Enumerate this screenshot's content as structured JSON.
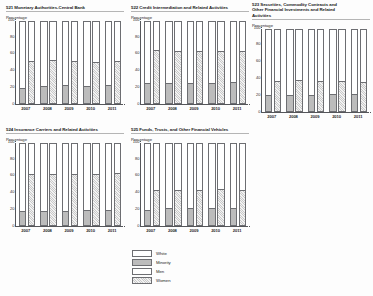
{
  "figure": {
    "axis_label": "Percentage",
    "years": [
      "2007",
      "2008",
      "2009",
      "2010",
      "2011"
    ],
    "yticks": [
      "0",
      "20",
      "40",
      "60",
      "80",
      "100"
    ],
    "ylim": [
      0,
      100
    ]
  },
  "legend": {
    "items": [
      {
        "label": "White",
        "swatch": "white-swatch"
      },
      {
        "label": "Minority",
        "swatch": "minority-swatch"
      },
      {
        "label": "Men",
        "swatch": "men-swatch"
      },
      {
        "label": "Women",
        "swatch": "women-swatch"
      }
    ]
  },
  "colors": {
    "minority_fill": "#bcbcbc",
    "women_hatch": "#c9c9c9",
    "white_fill": "#ffffff",
    "axis": "#55565a",
    "bar_outline": "#6d6e72"
  },
  "chart_data": [
    {
      "id": "naics-521",
      "type": "bar",
      "title": "521 Monetary Authorities-Central Bank",
      "xlabel": "",
      "ylabel": "Percentage",
      "ylim": [
        0,
        100
      ],
      "grid": false,
      "legend_position": "below-figure",
      "categories": [
        "2007",
        "2008",
        "2009",
        "2010",
        "2011"
      ],
      "series": [
        {
          "name": "Minority",
          "values": [
            18,
            20,
            21,
            20,
            21
          ]
        },
        {
          "name": "White",
          "values": [
            82,
            80,
            79,
            80,
            79
          ]
        },
        {
          "name": "Women",
          "values": [
            50,
            51,
            50,
            49,
            50
          ]
        },
        {
          "name": "Men",
          "values": [
            50,
            49,
            50,
            51,
            50
          ]
        }
      ]
    },
    {
      "id": "naics-522",
      "type": "bar",
      "title": "522 Credit Intermediation and Related Activities",
      "xlabel": "",
      "ylabel": "Percentage",
      "ylim": [
        0,
        100
      ],
      "grid": false,
      "legend_position": "below-figure",
      "categories": [
        "2007",
        "2008",
        "2009",
        "2010",
        "2011"
      ],
      "series": [
        {
          "name": "Minority",
          "values": [
            23,
            23,
            23,
            24,
            25
          ]
        },
        {
          "name": "White",
          "values": [
            77,
            77,
            77,
            76,
            75
          ]
        },
        {
          "name": "Women",
          "values": [
            63,
            62,
            62,
            61,
            61
          ]
        },
        {
          "name": "Men",
          "values": [
            37,
            38,
            38,
            39,
            39
          ]
        }
      ]
    },
    {
      "id": "naics-523",
      "type": "bar",
      "title": "523 Securities, Commodity Contracts and\nOther Financial Investments and  Related\nActivities",
      "xlabel": "",
      "ylabel": "Percentage",
      "ylim": [
        0,
        100
      ],
      "grid": false,
      "legend_position": "below-figure",
      "categories": [
        "2007",
        "2008",
        "2009",
        "2010",
        "2011"
      ],
      "series": [
        {
          "name": "Minority",
          "values": [
            18,
            19,
            19,
            20,
            20
          ]
        },
        {
          "name": "White",
          "values": [
            82,
            81,
            81,
            80,
            80
          ]
        },
        {
          "name": "Women",
          "values": [
            35,
            36,
            35,
            35,
            34
          ]
        },
        {
          "name": "Men",
          "values": [
            65,
            64,
            65,
            65,
            66
          ]
        }
      ]
    },
    {
      "id": "naics-524",
      "type": "bar",
      "title": "524 Insurance Carriers and Related Activities",
      "xlabel": "",
      "ylabel": "Percentage",
      "ylim": [
        0,
        100
      ],
      "grid": false,
      "legend_position": "below-figure",
      "categories": [
        "2007",
        "2008",
        "2009",
        "2010",
        "2011"
      ],
      "series": [
        {
          "name": "Minority",
          "values": [
            16,
            16,
            16,
            17,
            18
          ]
        },
        {
          "name": "White",
          "values": [
            84,
            84,
            84,
            83,
            82
          ]
        },
        {
          "name": "Women",
          "values": [
            60,
            60,
            60,
            60,
            61
          ]
        },
        {
          "name": "Men",
          "values": [
            40,
            40,
            40,
            40,
            39
          ]
        }
      ]
    },
    {
      "id": "naics-525",
      "type": "bar",
      "title": "525 Funds, Trusts, and Other Financial Vehicles",
      "xlabel": "",
      "ylabel": "Percentage",
      "ylim": [
        0,
        100
      ],
      "grid": false,
      "legend_position": "below-figure",
      "categories": [
        "2007",
        "2008",
        "2009",
        "2010",
        "2011"
      ],
      "series": [
        {
          "name": "Minority",
          "values": [
            18,
            20,
            20,
            20,
            20
          ]
        },
        {
          "name": "White",
          "values": [
            82,
            80,
            80,
            80,
            80
          ]
        },
        {
          "name": "Women",
          "values": [
            41,
            41,
            41,
            42,
            41
          ]
        },
        {
          "name": "Men",
          "values": [
            59,
            59,
            59,
            58,
            59
          ]
        }
      ]
    }
  ]
}
